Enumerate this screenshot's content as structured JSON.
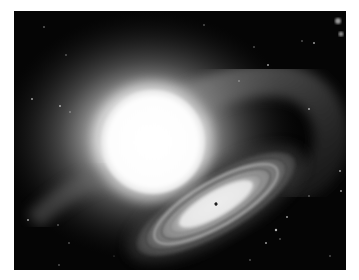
{
  "image": {
    "subject": "Binary star system illustration: bright star with gas stream flowing into a spiral accretion disk, grayscale",
    "colors": {
      "background": "#050505",
      "page": "#ffffff",
      "star_core": "#ffffff",
      "glow": "#bdbdbd",
      "disk_light": "#e8e8e8",
      "disk_dark": "#4a4a4a"
    },
    "elements": {
      "star": {
        "cx": 139,
        "cy": 131,
        "r": 52
      },
      "disk": {
        "cx": 202,
        "cy": 193,
        "rx": 84,
        "ry": 27,
        "rotation": -30
      },
      "disk_center_dot": {
        "cx": 202,
        "cy": 193
      },
      "bright_stars_top_right": [
        {
          "cx": 324,
          "cy": 10
        },
        {
          "cx": 327,
          "cy": 23
        }
      ]
    }
  }
}
